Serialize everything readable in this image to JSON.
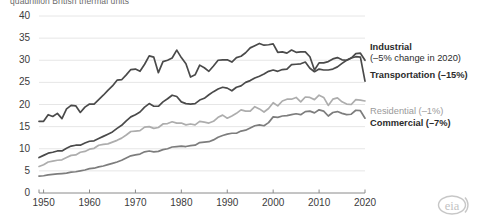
{
  "chart_title": "quadrillion British thermal units",
  "axes": {
    "y_ticks": [
      "0",
      "5",
      "10",
      "15",
      "20",
      "25",
      "30",
      "35",
      "40"
    ],
    "x_ticks": [
      "1950",
      "1960",
      "1970",
      "1980",
      "1990",
      "2000",
      "2010",
      "2020"
    ],
    "ylim": [
      0,
      40
    ],
    "xlim": [
      1949,
      2020
    ]
  },
  "labels": {
    "industrial": "Industrial",
    "industrial_sub": "(–5% change in 2020)",
    "transportation": "Transportation (–15%)",
    "residential": "Residential (–1%)",
    "commercial": "Commercial (–7%)"
  },
  "logo": {
    "text": "eia"
  },
  "colors": {
    "industrial": "#4a4a4a",
    "transportation": "#4a4a4a",
    "residential": "#adadad",
    "commercial": "#7d7d7d",
    "grid": "#e6e6e6",
    "axis": "#8a8a8a"
  },
  "chart_data": {
    "type": "line",
    "title": "quadrillion British thermal units",
    "xlabel": "",
    "ylabel": "quadrillion British thermal units",
    "xlim": [
      1949,
      2020
    ],
    "ylim": [
      0,
      40
    ],
    "grid": true,
    "legend_position": "right-inline-labels",
    "x": [
      1949,
      1950,
      1951,
      1952,
      1953,
      1954,
      1955,
      1956,
      1957,
      1958,
      1959,
      1960,
      1961,
      1962,
      1963,
      1964,
      1965,
      1966,
      1967,
      1968,
      1969,
      1970,
      1971,
      1972,
      1973,
      1974,
      1975,
      1976,
      1977,
      1978,
      1979,
      1980,
      1981,
      1982,
      1983,
      1984,
      1985,
      1986,
      1987,
      1988,
      1989,
      1990,
      1991,
      1992,
      1993,
      1994,
      1995,
      1996,
      1997,
      1998,
      1999,
      2000,
      2001,
      2002,
      2003,
      2004,
      2005,
      2006,
      2007,
      2008,
      2009,
      2010,
      2011,
      2012,
      2013,
      2014,
      2015,
      2016,
      2017,
      2018,
      2019,
      2020
    ],
    "series": [
      {
        "name": "Industrial",
        "annotation": "(–5% change in 2020)",
        "color": "#4a4a4a",
        "values": [
          16.2,
          16.2,
          17.7,
          17.3,
          18.0,
          16.8,
          19.0,
          19.8,
          19.7,
          18.2,
          19.4,
          20.1,
          20.1,
          21.1,
          22.1,
          23.2,
          24.2,
          25.5,
          25.6,
          26.7,
          27.9,
          28.0,
          27.5,
          29.1,
          31.0,
          30.7,
          27.2,
          29.7,
          30.0,
          30.5,
          32.3,
          30.6,
          29.2,
          26.2,
          26.7,
          28.9,
          28.3,
          27.5,
          28.7,
          30.0,
          30.1,
          30.1,
          29.6,
          30.6,
          30.9,
          31.7,
          32.8,
          33.3,
          33.8,
          33.4,
          33.5,
          33.7,
          31.8,
          31.9,
          31.6,
          32.3,
          31.8,
          31.9,
          31.9,
          30.8,
          27.8,
          29.4,
          29.4,
          29.7,
          30.3,
          30.6,
          30.1,
          30.0,
          30.5,
          31.5,
          31.6,
          30.0
        ],
        "end_value": 30.0
      },
      {
        "name": "Transportation",
        "annotation": "(–15%)",
        "color": "#4a4a4a",
        "values": [
          8.0,
          8.5,
          9.0,
          9.2,
          9.5,
          9.5,
          10.1,
          10.6,
          10.8,
          10.8,
          11.3,
          11.7,
          11.8,
          12.3,
          12.8,
          13.3,
          13.8,
          14.6,
          15.3,
          16.3,
          17.2,
          17.7,
          18.3,
          19.4,
          20.2,
          19.6,
          19.6,
          20.6,
          21.3,
          22.1,
          21.8,
          20.6,
          20.2,
          20.1,
          20.2,
          21.0,
          21.4,
          22.2,
          22.9,
          23.5,
          23.9,
          23.7,
          23.1,
          23.9,
          24.2,
          25.0,
          25.4,
          26.0,
          26.4,
          26.9,
          27.5,
          27.8,
          27.5,
          27.9,
          28.0,
          29.0,
          29.1,
          29.2,
          29.6,
          28.2,
          27.4,
          28.0,
          27.8,
          27.8,
          28.0,
          28.5,
          29.3,
          30.0,
          30.5,
          30.8,
          30.7,
          25.3
        ],
        "end_value": 25.3
      },
      {
        "name": "Residential",
        "annotation": "(–1%)",
        "color": "#adadad",
        "values": [
          6.0,
          6.4,
          7.0,
          7.2,
          7.4,
          7.5,
          8.0,
          8.5,
          8.6,
          9.2,
          9.4,
          9.9,
          10.1,
          10.8,
          11.0,
          11.1,
          11.5,
          11.9,
          12.4,
          13.1,
          13.9,
          14.0,
          14.1,
          14.9,
          15.0,
          14.6,
          14.8,
          15.6,
          15.7,
          16.1,
          15.8,
          15.8,
          15.4,
          15.6,
          15.4,
          16.2,
          16.0,
          15.8,
          16.2,
          17.1,
          17.6,
          16.9,
          17.4,
          18.0,
          18.8,
          18.5,
          18.5,
          19.5,
          19.0,
          18.3,
          19.1,
          20.4,
          19.7,
          20.8,
          21.2,
          21.2,
          21.6,
          20.6,
          21.7,
          21.6,
          21.1,
          22.1,
          21.6,
          19.8,
          21.2,
          21.5,
          20.6,
          20.1,
          20.0,
          21.1,
          21.0,
          20.8
        ],
        "end_value": 20.8
      },
      {
        "name": "Commercial",
        "annotation": "(–7%)",
        "color": "#7d7d7d",
        "values": [
          3.8,
          3.9,
          4.1,
          4.2,
          4.3,
          4.4,
          4.5,
          4.7,
          4.8,
          5.0,
          5.2,
          5.5,
          5.6,
          5.9,
          6.1,
          6.4,
          6.7,
          7.0,
          7.4,
          7.9,
          8.4,
          8.6,
          8.8,
          9.3,
          9.5,
          9.3,
          9.4,
          9.8,
          10.0,
          10.4,
          10.5,
          10.6,
          10.5,
          10.7,
          10.8,
          11.4,
          11.5,
          11.6,
          12.0,
          12.6,
          13.0,
          13.3,
          13.5,
          13.5,
          14.0,
          14.2,
          14.7,
          15.2,
          15.4,
          15.2,
          15.9,
          17.2,
          17.1,
          17.4,
          17.5,
          17.7,
          17.9,
          17.7,
          18.4,
          18.5,
          18.1,
          18.8,
          18.5,
          17.4,
          18.2,
          18.4,
          18.0,
          17.7,
          17.8,
          18.7,
          18.6,
          16.9
        ],
        "end_value": 16.9
      }
    ]
  }
}
